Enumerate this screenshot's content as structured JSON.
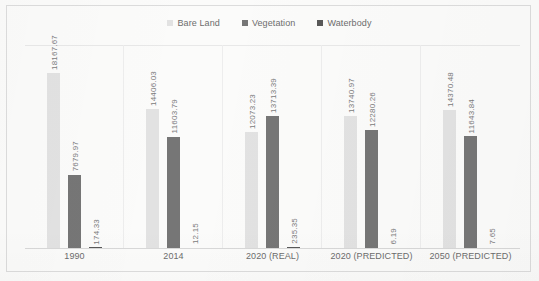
{
  "chart_data": {
    "type": "bar",
    "title": "",
    "subtitle": "",
    "xlabel": "",
    "ylabel": "",
    "grid": false,
    "legend_position": "top-center",
    "axis_visible": {
      "y_ticks": false,
      "x_axis_line": true
    },
    "ylim": [
      0,
      18167.67
    ],
    "categories": [
      "1990",
      "2014",
      "2020 (REAL)",
      "2020 (PREDICTED)",
      "2050 (PREDICTED)"
    ],
    "series": [
      {
        "name": "Bare Land",
        "color": "#e2e2e2",
        "values": [
          18167.67,
          14406.03,
          12073.23,
          13740.97,
          14370.48
        ],
        "labels": [
          "18167.67",
          "14406.03",
          "12073.23",
          "13740.97",
          "14370.48"
        ]
      },
      {
        "name": "Vegetation",
        "color": "#767676",
        "values": [
          7679.97,
          11603.79,
          13713.39,
          12280.26,
          11643.84
        ],
        "labels": [
          "7679.97",
          "11603.79",
          "13713.39",
          "12280.26",
          "11643.84"
        ]
      },
      {
        "name": "Waterbody",
        "color": "#585858",
        "values": [
          174.33,
          12.15,
          235.35,
          6.19,
          7.65
        ],
        "labels": [
          "174.33",
          "12.15",
          "235.35",
          "6.19",
          "7.65"
        ]
      }
    ]
  },
  "legend": {
    "items": [
      {
        "label": "Bare Land",
        "color": "#e2e2e2"
      },
      {
        "label": "Vegetation",
        "color": "#767676"
      },
      {
        "label": "Waterbody",
        "color": "#585858"
      }
    ]
  }
}
